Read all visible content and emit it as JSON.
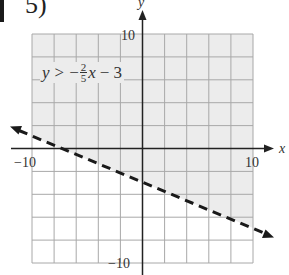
{
  "problem": {
    "number": "5)"
  },
  "graph": {
    "x_axis_label": "x",
    "y_axis_label": "y",
    "x_min_label": "−10",
    "x_max_label": "10",
    "y_max_label": "10",
    "y_min_label": "−10",
    "grid": {
      "cells": 10,
      "units_per_cell": 2,
      "range": [
        -10,
        10
      ]
    },
    "colors": {
      "shaded": "#ececec",
      "unshaded": "#ffffff",
      "grid": "#a8a8a8",
      "axis": "#222222",
      "boundary": "#1a1a1a"
    }
  },
  "inequality": {
    "lhs": "y",
    "operator": ">",
    "sign": "−",
    "numerator": "2",
    "denominator": "5",
    "var": "x",
    "constant": "− 3",
    "boundary_style": "dashed",
    "shaded_region": "above"
  }
}
